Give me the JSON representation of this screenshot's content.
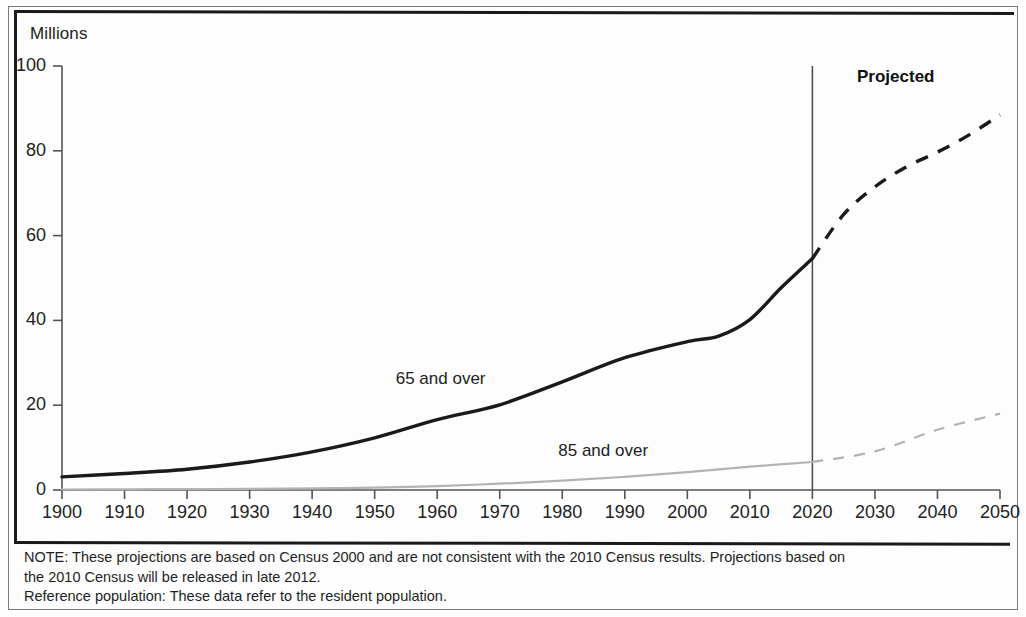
{
  "figure": {
    "unit_label": "Millions",
    "projected_label": "Projected"
  },
  "notes": {
    "line1": "NOTE: These projections are based on Census 2000 and are not consistent with the 2010 Census results. Projections based on",
    "line2": "the 2010 Census will be released in late 2012.",
    "line3": "Reference population: These data refer to the resident population."
  },
  "chart_data": {
    "type": "line",
    "title": "",
    "subtitle": "",
    "xlabel": "",
    "ylabel": "Millions",
    "xlim": [
      1900,
      2050
    ],
    "ylim": [
      0,
      100
    ],
    "grid": false,
    "legend_position": "inline-annotations",
    "xticks": [
      1900,
      1910,
      1920,
      1930,
      1940,
      1950,
      1960,
      1970,
      1980,
      1990,
      2000,
      2010,
      2020,
      2030,
      2040,
      2050
    ],
    "xtick_labels": [
      "1900",
      "1910",
      "1920",
      "1930",
      "1940",
      "1950",
      "1960",
      "1970",
      "1980",
      "1990",
      "2000",
      "2010",
      "2020",
      "2030",
      "2040",
      "2050"
    ],
    "yticks": [
      0,
      20,
      40,
      60,
      80,
      100
    ],
    "ytick_labels": [
      "0",
      "20",
      "40",
      "60",
      "80",
      "100"
    ],
    "projection_start_year": 2020,
    "annotations": [
      {
        "text": "65 and over",
        "x": 1962,
        "y": 26
      },
      {
        "text": "85 and over",
        "x": 1988,
        "y": 9
      },
      {
        "text": "Projected",
        "x": 2035,
        "y": 92
      }
    ],
    "series": [
      {
        "name": "65 and over",
        "color": "#1a1a1a",
        "style_actual": "solid",
        "style_projected": "dashed",
        "x": [
          1900,
          1910,
          1920,
          1930,
          1940,
          1950,
          1960,
          1970,
          1980,
          1990,
          2000,
          2005,
          2010,
          2015,
          2020,
          2025,
          2030,
          2035,
          2040,
          2045,
          2050
        ],
        "values": [
          3.1,
          3.9,
          4.9,
          6.6,
          9.0,
          12.3,
          16.6,
          20.1,
          25.5,
          31.2,
          35.0,
          36.3,
          40.2,
          47.7,
          54.6,
          65.0,
          71.5,
          76.2,
          79.7,
          83.7,
          88.5
        ]
      },
      {
        "name": "85 and over",
        "color": "#b3b3b3",
        "style_actual": "solid",
        "style_projected": "dashed",
        "x": [
          1900,
          1910,
          1920,
          1930,
          1940,
          1950,
          1960,
          1970,
          1980,
          1990,
          2000,
          2010,
          2020,
          2030,
          2040,
          2050
        ],
        "values": [
          0.12,
          0.17,
          0.21,
          0.27,
          0.37,
          0.58,
          0.93,
          1.5,
          2.2,
          3.1,
          4.2,
          5.5,
          6.6,
          9.1,
          14.2,
          18.0
        ]
      }
    ]
  }
}
